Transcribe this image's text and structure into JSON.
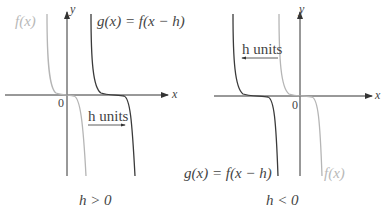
{
  "left_panel": {
    "f_label": "f(x)",
    "g_label": "g(x) = f(x − h)",
    "shift_label": "h units",
    "shift_direction": "right",
    "origin": "0",
    "x_axis": "x",
    "y_axis": "y",
    "caption": "h > 0"
  },
  "right_panel": {
    "f_label": "f(x)",
    "g_label": "g(x) = f(x − h)",
    "shift_label": "h units",
    "shift_direction": "left",
    "origin": "0",
    "x_axis": "x",
    "y_axis": "y",
    "caption": "h < 0"
  },
  "colors": {
    "f_curve": "#b5b5b5",
    "g_curve": "#3a3a3a",
    "axis": "#333333"
  }
}
